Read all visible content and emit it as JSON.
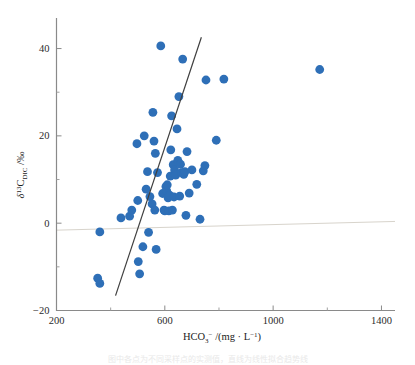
{
  "figure": {
    "caption": "图中各点为不同采样点的实测值，直线为线性拟合趋势线"
  },
  "chart_data": {
    "type": "scatter",
    "title": "",
    "xlabel": "HCO3-/(mg · L-1)",
    "ylabel": "d13C_DIC /‰",
    "xlim": [
      200,
      1450
    ],
    "ylim": [
      -20,
      47
    ],
    "xticks": [
      200,
      600,
      1000,
      1400
    ],
    "yticks": [
      -20,
      0,
      20,
      40
    ],
    "xminorticks": [
      400,
      800,
      1200
    ],
    "yminorticks": [
      -10,
      10,
      30
    ],
    "grid": false,
    "legend": "none",
    "marker_color": "#2E6FB7",
    "marker_size": 4.4,
    "trendline": {
      "type": "linear",
      "color": "#3f3f3f",
      "x_start": 418,
      "y_start": -16.6,
      "x_end": 735,
      "y_end": 42.6
    },
    "reference_line": {
      "color": "#d8d4cc",
      "x_start": 200,
      "y_start": -1.6,
      "x_end": 1450,
      "y_end": 0.4
    },
    "points": [
      [
        352,
        -12.6
      ],
      [
        360,
        -13.8
      ],
      [
        360,
        -2.0
      ],
      [
        438,
        1.2
      ],
      [
        470,
        1.6
      ],
      [
        478,
        3.0
      ],
      [
        497,
        18.2
      ],
      [
        500,
        5.2
      ],
      [
        502,
        -8.8
      ],
      [
        507,
        -11.6
      ],
      [
        519,
        -5.4
      ],
      [
        524,
        20.0
      ],
      [
        531,
        7.8
      ],
      [
        536,
        11.8
      ],
      [
        540,
        -2.1
      ],
      [
        545,
        6.1
      ],
      [
        553,
        4.4
      ],
      [
        556,
        25.4
      ],
      [
        560,
        18.8
      ],
      [
        563,
        3.0
      ],
      [
        565,
        16.0
      ],
      [
        568,
        -6.0
      ],
      [
        573,
        11.6
      ],
      [
        585,
        40.6
      ],
      [
        592,
        6.8
      ],
      [
        597,
        3.0
      ],
      [
        600,
        2.8
      ],
      [
        604,
        8.4
      ],
      [
        607,
        7.4
      ],
      [
        609,
        8.8
      ],
      [
        612,
        5.8
      ],
      [
        615,
        2.8
      ],
      [
        618,
        6.4
      ],
      [
        620,
        10.8
      ],
      [
        622,
        16.8
      ],
      [
        625,
        24.6
      ],
      [
        628,
        3.0
      ],
      [
        631,
        13.4
      ],
      [
        634,
        6.0
      ],
      [
        636,
        12.2
      ],
      [
        640,
        11.0
      ],
      [
        645,
        21.6
      ],
      [
        648,
        14.4
      ],
      [
        652,
        29.0
      ],
      [
        655,
        6.2
      ],
      [
        658,
        13.5
      ],
      [
        662,
        11.6
      ],
      [
        666,
        37.6
      ],
      [
        670,
        11.2
      ],
      [
        674,
        11.8
      ],
      [
        678,
        1.8
      ],
      [
        682,
        16.4
      ],
      [
        690,
        6.9
      ],
      [
        700,
        12.2
      ],
      [
        718,
        8.9
      ],
      [
        730,
        0.9
      ],
      [
        742,
        12.0
      ],
      [
        748,
        13.2
      ],
      [
        752,
        32.8
      ],
      [
        790,
        19.0
      ],
      [
        818,
        33.0
      ],
      [
        1172,
        35.2
      ]
    ]
  }
}
